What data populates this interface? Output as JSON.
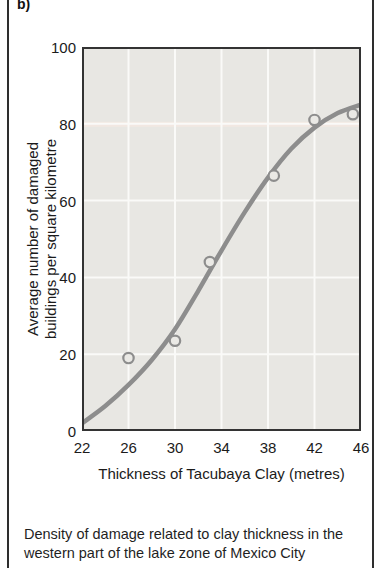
{
  "figure": {
    "panel_label": "b)",
    "caption_line1": "Density of damage related to clay thickness in the",
    "caption_line2": "western part of the lake zone of Mexico City"
  },
  "chart_data": {
    "type": "scatter",
    "title": "",
    "xlabel": "Thickness of Tacubaya Clay (metres)",
    "ylabel_line1": "Average number of damaged",
    "ylabel_line2": "buildings per square kilometre",
    "xlim": [
      22,
      46
    ],
    "ylim": [
      0,
      100
    ],
    "x_ticks": [
      22,
      26,
      30,
      34,
      38,
      42,
      46
    ],
    "y_ticks": [
      0,
      20,
      40,
      60,
      80,
      100
    ],
    "grid": true,
    "legend": "none",
    "points": {
      "x": [
        26,
        30,
        33,
        38.5,
        42,
        45.3
      ],
      "y": [
        19,
        23.5,
        44,
        66.5,
        81,
        82.5
      ]
    },
    "curve": {
      "description": "fitted S-shaped trend curve",
      "x": [
        22,
        24,
        26,
        28,
        30,
        32,
        34,
        36,
        38,
        40,
        42,
        44,
        46
      ],
      "y": [
        2,
        6.5,
        12,
        18.5,
        26.5,
        36.5,
        47,
        57,
        66,
        73.5,
        79,
        82.8,
        85
      ]
    },
    "colors": {
      "plot_bg": "#e8e7e3",
      "gridline": "#fafaf8",
      "band_at_80": "#f2e8e2",
      "curve": "#8d8d8d",
      "point_stroke": "#8d8d8d",
      "point_fill": "#eae9e5",
      "axis_frame": "#333333",
      "text": "#1b1b1b"
    }
  }
}
